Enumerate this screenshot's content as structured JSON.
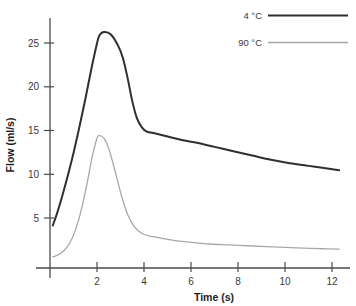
{
  "chart_data": {
    "type": "line",
    "title": "",
    "xlabel": "Time (s)",
    "ylabel": "Flow (ml/s)",
    "xlim": [
      0,
      12.4
    ],
    "ylim": [
      0,
      28
    ],
    "xticks": [
      2,
      4,
      6,
      8,
      10,
      12
    ],
    "yticks": [
      5,
      10,
      15,
      20,
      25
    ],
    "grid": false,
    "legend_position": "top-right",
    "series": [
      {
        "name": "4 °C",
        "color": "#2f2f2f",
        "x": [
          0.12,
          0.3,
          0.5,
          0.75,
          1.0,
          1.25,
          1.5,
          1.75,
          2.0,
          2.1,
          2.3,
          2.6,
          2.9,
          3.1,
          3.3,
          3.5,
          3.7,
          3.9,
          4.1,
          4.4,
          5.0,
          5.6,
          6.2,
          7.0,
          7.8,
          8.6,
          9.4,
          10.2,
          11.0,
          11.8,
          12.3
        ],
        "y": [
          4.2,
          5.6,
          7.4,
          9.9,
          12.6,
          15.6,
          18.8,
          22.2,
          25.3,
          26.2,
          26.6,
          26.3,
          25.0,
          23.6,
          21.3,
          18.6,
          16.6,
          15.6,
          15.1,
          14.9,
          14.5,
          14.1,
          13.8,
          13.3,
          12.8,
          12.3,
          11.8,
          11.4,
          11.1,
          10.8,
          10.6
        ]
      },
      {
        "name": "90 °C",
        "color": "#a8a8a8",
        "x": [
          0.12,
          0.35,
          0.6,
          0.85,
          1.1,
          1.35,
          1.6,
          1.8,
          2.0,
          2.1,
          2.3,
          2.5,
          2.7,
          2.9,
          3.1,
          3.3,
          3.6,
          3.9,
          4.2,
          4.6,
          5.2,
          6.0,
          6.8,
          7.6,
          8.4,
          9.2,
          10.0,
          10.8,
          11.6,
          12.3
        ],
        "y": [
          0.55,
          0.8,
          1.3,
          2.2,
          3.8,
          6.2,
          9.4,
          12.2,
          14.3,
          14.6,
          14.3,
          13.1,
          11.2,
          9.1,
          7.1,
          5.5,
          4.0,
          3.3,
          3.0,
          2.8,
          2.5,
          2.25,
          2.05,
          1.95,
          1.85,
          1.75,
          1.65,
          1.58,
          1.5,
          1.45
        ]
      }
    ],
    "legend": [
      {
        "label": "4 °C",
        "color": "#2f2f2f",
        "width": 2.0
      },
      {
        "label": "90 °C",
        "color": "#a8a8a8",
        "width": 1.3
      }
    ],
    "axis_color": "#4a4a4a"
  }
}
